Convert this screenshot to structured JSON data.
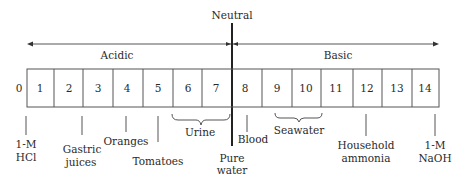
{
  "neutral_label": "Neutral",
  "acidic_label": "Acidic",
  "basic_label": "Basic",
  "scale": [
    "0",
    "1",
    "2",
    "3",
    "4",
    "5",
    "6",
    "7",
    "8",
    "9",
    "10",
    "11",
    "12",
    "13",
    "14"
  ],
  "markers": {
    "hcl": {
      "line1": "1-M",
      "line2": "HCl"
    },
    "gastric": {
      "line1": "Gastric",
      "line2": "juices"
    },
    "oranges": "Oranges",
    "tomatoes": "Tomatoes",
    "urine": "Urine",
    "pure_water": {
      "line1": "Pure",
      "line2": "water"
    },
    "blood": "Blood",
    "seawater": "Seawater",
    "ammonia": {
      "line1": "Household",
      "line2": "ammonia"
    },
    "naoh": {
      "line1": "1-M",
      "line2": "NaOH"
    }
  },
  "colors": {
    "line": "#555555",
    "text": "#2a2a2a",
    "neutral_line": "#222222"
  }
}
